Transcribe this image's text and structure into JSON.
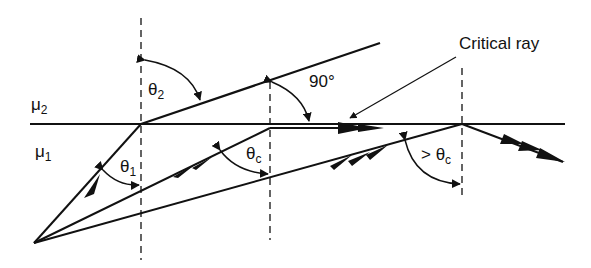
{
  "labels": {
    "mu2": "μ",
    "mu2_sub": "2",
    "mu1": "μ",
    "mu1_sub": "1",
    "theta2": "θ",
    "theta2_sub": "2",
    "theta1": "θ",
    "theta1_sub": "1",
    "thetac": "θ",
    "thetac_sub": "c",
    "right_angle": "90°",
    "gt_thetac": "> θ",
    "gt_thetac_sub": "c",
    "critical_ray": "Critical ray"
  },
  "colors": {
    "line": "#111111",
    "background": "#ffffff"
  }
}
